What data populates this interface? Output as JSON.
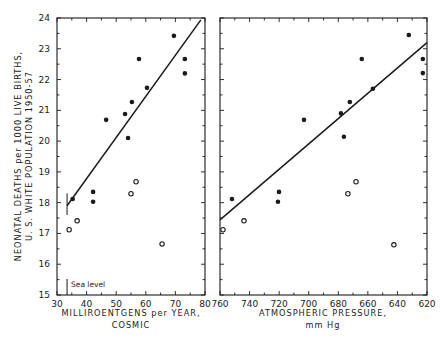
{
  "chart_data": [
    {
      "type": "scatter",
      "title": "",
      "xlabel": "MILLIROENTGENS per YEAR, COSMIC",
      "xlabel_lines": [
        "MILLIROENTGENS per YEAR,",
        "COSMIC"
      ],
      "ylabel": "NEONATAL DEATHS per 1000 LIVE BIRTHS, U. S. WHITE POPULATION 1950-57",
      "ylabel_lines": [
        "NEONATAL DEATHS per 1000 LIVE BIRTHS,",
        "U. S. WHITE POPULATION 1950-57"
      ],
      "xlim": [
        30,
        80
      ],
      "ylim": [
        15,
        24
      ],
      "xticks": [
        30,
        40,
        50,
        60,
        70,
        80
      ],
      "yticks": [
        15,
        16,
        17,
        18,
        19,
        20,
        21,
        22,
        23,
        24
      ],
      "grid": false,
      "annotation": {
        "text": "Sea level",
        "x": 33.4
      },
      "series": [
        {
          "name": "filled",
          "marker": "filled-circle",
          "points": [
            [
              69.5,
              23.42
            ],
            [
              57.7,
              22.67
            ],
            [
              73.2,
              22.67
            ],
            [
              73.2,
              22.2
            ],
            [
              60.4,
              21.73
            ],
            [
              55.3,
              21.27
            ],
            [
              53.0,
              20.88
            ],
            [
              46.6,
              20.69
            ],
            [
              54.0,
              20.1
            ],
            [
              35.3,
              18.12
            ],
            [
              42.2,
              18.35
            ],
            [
              42.2,
              18.03
            ]
          ]
        },
        {
          "name": "open",
          "marker": "open-circle",
          "points": [
            [
              34.1,
              17.12
            ],
            [
              36.8,
              17.41
            ],
            [
              55.0,
              18.29
            ],
            [
              56.7,
              18.68
            ],
            [
              65.5,
              16.66
            ]
          ]
        },
        {
          "name": "regression-line",
          "type": "line",
          "points": [
            [
              33.4,
              17.9
            ],
            [
              78.6,
              23.94
            ]
          ]
        }
      ]
    },
    {
      "type": "scatter",
      "title": "",
      "xlabel": "ATMOSPHERIC PRESSURE, mm Hg",
      "xlabel_lines": [
        "ATMOSPHERIC PRESSURE,",
        "mm Hg"
      ],
      "ylabel": "",
      "xlim": [
        760,
        620
      ],
      "ylim": [
        15,
        24
      ],
      "xticks": [
        760,
        740,
        720,
        700,
        680,
        660,
        640,
        620
      ],
      "yticks": [
        15,
        16,
        17,
        18,
        19,
        20,
        21,
        22,
        23,
        24
      ],
      "grid": false,
      "series": [
        {
          "name": "filled",
          "marker": "filled-circle",
          "points": [
            [
              632.3,
              23.45
            ],
            [
              622.8,
              22.67
            ],
            [
              622.8,
              22.21
            ],
            [
              664.1,
              22.67
            ],
            [
              656.6,
              21.7
            ],
            [
              672.2,
              21.27
            ],
            [
              678.2,
              20.9
            ],
            [
              703.2,
              20.69
            ],
            [
              676.2,
              20.14
            ],
            [
              751.9,
              18.12
            ],
            [
              720.1,
              18.35
            ],
            [
              720.8,
              18.03
            ]
          ]
        },
        {
          "name": "open",
          "marker": "open-circle",
          "points": [
            [
              758.0,
              17.12
            ],
            [
              743.8,
              17.41
            ],
            [
              673.5,
              18.29
            ],
            [
              668.0,
              18.68
            ],
            [
              642.4,
              16.63
            ]
          ]
        },
        {
          "name": "regression-line",
          "type": "line",
          "points": [
            [
              760,
              17.44
            ],
            [
              620,
              23.2
            ]
          ]
        }
      ]
    }
  ],
  "layout": {
    "ink": "#1a1a1a",
    "panels": [
      {
        "px": [
          57,
          205
        ],
        "py": [
          18,
          295
        ]
      },
      {
        "px": [
          220,
          427
        ],
        "py": [
          18,
          295
        ]
      }
    ]
  }
}
